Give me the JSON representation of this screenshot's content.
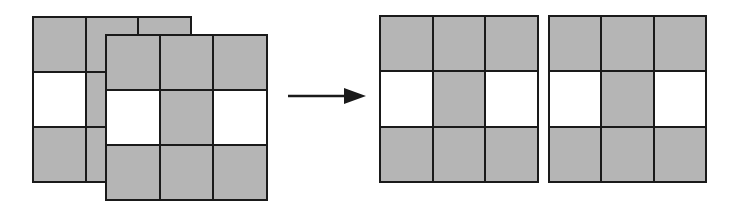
{
  "diagram": {
    "colors": {
      "filled": "#b5b5b5",
      "empty": "#ffffff",
      "stroke": "#1a1a1a"
    },
    "input": {
      "back_grid": {
        "cells": [
          "g",
          "g",
          "g",
          "w",
          "g",
          "g",
          "g",
          "g",
          "g"
        ]
      },
      "front_grid": {
        "cells": [
          "g",
          "g",
          "g",
          "w",
          "g",
          "w",
          "g",
          "g",
          "g"
        ]
      }
    },
    "arrow": {
      "icon": "right-arrow-icon"
    },
    "output": {
      "grid_a": {
        "cells": [
          "g",
          "g",
          "g",
          "w",
          "g",
          "w",
          "g",
          "g",
          "g"
        ]
      },
      "grid_b": {
        "cells": [
          "g",
          "g",
          "g",
          "w",
          "g",
          "w",
          "g",
          "g",
          "g"
        ]
      }
    }
  }
}
